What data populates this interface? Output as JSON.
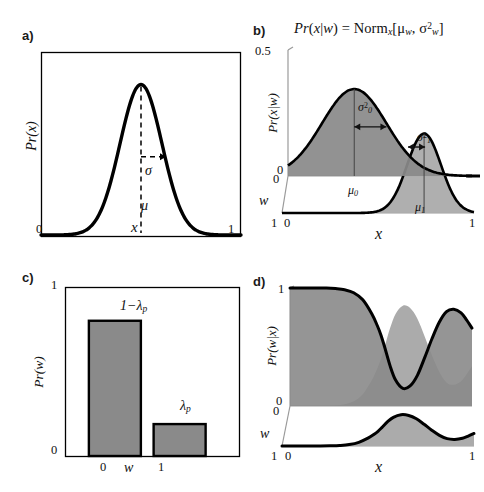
{
  "figure": {
    "width": 484,
    "height": 492,
    "background": "#ffffff",
    "ink": "#000000",
    "fill_dark": "#8a8a8a",
    "fill_light": "#ababab",
    "fill_bar": "#8a8a8a",
    "axis_gray": "#9a9a9a"
  },
  "panels": {
    "a": {
      "label": "a)",
      "ylabel": "Pr(x)",
      "xlabel": "x",
      "xticks": [
        "0",
        "1"
      ],
      "annotations": {
        "mean": "μ",
        "sigma": "σ"
      }
    },
    "b": {
      "label": "b)",
      "equation_parts": {
        "lhs": "Pr(x|w)",
        "eq": "=",
        "norm": "Norm",
        "norm_sub": "x",
        "bracket_open": "[",
        "mu": "μ",
        "mu_sub": "w",
        "comma": ",",
        "sigma": "σ",
        "sigma_sup": "2",
        "sigma_sub": "w",
        "bracket_close": "]"
      },
      "equation_plain": "Pr(x|w) = Norm_x[μ_w, σ²_w]",
      "ylabel": "Pr(x|w)",
      "xlabel": "x",
      "yticks": [
        "0.5",
        "0"
      ],
      "waxis_label": "w",
      "wticks": [
        "0",
        "1"
      ],
      "xticks": [
        "0",
        "1"
      ],
      "annotations": {
        "mu0": "μ",
        "mu0_sub": "0",
        "mu1": "μ",
        "mu1_sub": "1",
        "sigma0": "σ",
        "sigma0_sup": "2",
        "sigma0_sub": "0",
        "sigma1": "σ",
        "sigma1_sup": "2",
        "sigma1_sub": "1"
      }
    },
    "c": {
      "label": "c)",
      "ylabel": "Pr(w)",
      "xlabel": "w",
      "yticks": [
        "1",
        "0"
      ],
      "xticks": [
        "0",
        "1"
      ],
      "bar_labels": {
        "left": "1−λ",
        "left_sub": "p",
        "right": "λ",
        "right_sub": "p"
      }
    },
    "d": {
      "label": "d)",
      "ylabel": "Pr(w|x)",
      "xlabel": "x",
      "yticks": [
        "1",
        "0"
      ],
      "waxis_label": "w",
      "wticks": [
        "0",
        "1"
      ],
      "xticks": [
        "0",
        "1"
      ]
    }
  },
  "chart_data": [
    {
      "id": "panel-a",
      "type": "line",
      "title": "",
      "xlabel": "x",
      "ylabel": "Pr(x)",
      "xlim": [
        0,
        1
      ],
      "ylim": [
        0,
        1
      ],
      "grid": false,
      "legend": "none",
      "series": [
        {
          "name": "gaussian",
          "distribution": "normal",
          "mu": 0.5,
          "sigma": 0.105,
          "peak": 0.86
        }
      ],
      "annotations": [
        {
          "text": "μ",
          "type": "vertical-dashed-line",
          "x": 0.5,
          "y_from": 0,
          "y_to": 0.86
        },
        {
          "text": "σ",
          "type": "horizontal-dashed-arrow",
          "x_from": 0.5,
          "x_to": 0.605,
          "y": 0.52
        }
      ]
    },
    {
      "id": "panel-b",
      "type": "area",
      "title": "Pr(x|w) = Norm_x[μ_w, σ²_w]",
      "xlabel": "x",
      "ylabel": "Pr(x|w)",
      "xlim": [
        0,
        1
      ],
      "ylim": [
        0,
        0.5
      ],
      "yticks": [
        0,
        0.5
      ],
      "grid": false,
      "legend": "none",
      "series": [
        {
          "name": "Pr(x|w=0)",
          "plane": "w=0",
          "distribution": "normal",
          "mu": 0.36,
          "sigma": 0.175,
          "peak": 0.345,
          "fill": "#8a8a8a"
        },
        {
          "name": "Pr(x|w=1)",
          "plane": "w=1",
          "distribution": "normal",
          "mu": 0.74,
          "sigma": 0.088,
          "peak": 0.315,
          "fill": "#ababab"
        }
      ],
      "annotations": [
        {
          "text": "μ_0",
          "type": "tick",
          "x": 0.36
        },
        {
          "text": "μ_1",
          "type": "tick",
          "x": 0.74
        },
        {
          "text": "σ²_0",
          "type": "double-arrow",
          "x_from": 0.36,
          "x_to": 0.535,
          "y": 0.195
        },
        {
          "text": "σ²_1",
          "type": "double-arrow",
          "x_from": 0.652,
          "x_to": 0.74,
          "y": 0.115
        }
      ]
    },
    {
      "id": "panel-c",
      "type": "bar",
      "title": "",
      "xlabel": "w",
      "ylabel": "Pr(w)",
      "categories": [
        "0",
        "1"
      ],
      "values": [
        0.805,
        0.19
      ],
      "value_labels": [
        "1−λ_p",
        "λ_p"
      ],
      "xlim": [
        0,
        1
      ],
      "ylim": [
        0,
        1
      ],
      "yticks": [
        0,
        1
      ],
      "grid": false,
      "legend": "none",
      "bar_color": "#8a8a8a"
    },
    {
      "id": "panel-d",
      "type": "area",
      "title": "",
      "xlabel": "x",
      "ylabel": "Pr(w|x)",
      "xlim": [
        0,
        1
      ],
      "ylim": [
        0,
        1
      ],
      "yticks": [
        0,
        1
      ],
      "grid": false,
      "legend": "none",
      "series": [
        {
          "name": "Pr(w=0|x)",
          "plane": "w=0",
          "fill": "#8a8a8a",
          "x": [
            0.0,
            0.05,
            0.1,
            0.15,
            0.2,
            0.25,
            0.3,
            0.35,
            0.4,
            0.45,
            0.48,
            0.5,
            0.52,
            0.55,
            0.58,
            0.62,
            0.66,
            0.7,
            0.74,
            0.78,
            0.82,
            0.86,
            0.9,
            0.94,
            0.97,
            1.0
          ],
          "y": [
            1.0,
            1.0,
            1.0,
            1.0,
            1.0,
            0.995,
            0.985,
            0.96,
            0.9,
            0.78,
            0.68,
            0.6,
            0.5,
            0.34,
            0.22,
            0.15,
            0.17,
            0.26,
            0.41,
            0.57,
            0.71,
            0.8,
            0.82,
            0.79,
            0.73,
            0.66
          ]
        },
        {
          "name": "Pr(w=1|x)",
          "plane": "w=1",
          "fill": "#ababab",
          "x": [
            0.0,
            0.05,
            0.1,
            0.15,
            0.2,
            0.25,
            0.3,
            0.35,
            0.4,
            0.45,
            0.48,
            0.5,
            0.52,
            0.55,
            0.58,
            0.62,
            0.66,
            0.7,
            0.74,
            0.78,
            0.82,
            0.86,
            0.9,
            0.94,
            0.97,
            1.0
          ],
          "y": [
            0.0,
            0.0,
            0.0,
            0.0,
            0.0,
            0.005,
            0.015,
            0.04,
            0.1,
            0.22,
            0.32,
            0.4,
            0.5,
            0.66,
            0.78,
            0.85,
            0.83,
            0.74,
            0.59,
            0.43,
            0.29,
            0.2,
            0.18,
            0.21,
            0.27,
            0.34
          ]
        }
      ]
    }
  ]
}
